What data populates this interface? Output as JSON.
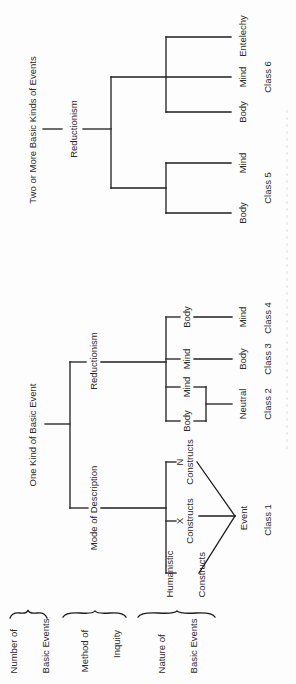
{
  "diagram": {
    "orientation": "rotated 90 degrees counter-clockwise",
    "row_labels": {
      "number_of_basic_events": [
        "Number of",
        "Basic Events"
      ],
      "method_of_inquiry": [
        "Method of",
        "Inquity"
      ],
      "nature_of_basic_events": [
        "Nature of",
        "Basic Events"
      ]
    },
    "level1": {
      "one_kind": "One Kind of Basic Event",
      "two_or_more": "Two or More Basic Kinds of Events"
    },
    "level2": {
      "mode_of_description": "Mode of Description",
      "reductionism_one": "Reductionism",
      "reductionism_two": "Reductionism"
    },
    "class1": {
      "n_letter": "N",
      "n_constructs": "Constructs",
      "x_letter": "X",
      "x_constructs": "Constructs",
      "humanistic": [
        "Humanistic",
        "Constructs"
      ],
      "event": "Event",
      "label": "Class 1"
    },
    "class2": {
      "body": "Body",
      "mind": "Mind",
      "result": "Neutral",
      "label": "Class 2"
    },
    "class3": {
      "from": "Mind",
      "to": "Body",
      "label": "Class 3"
    },
    "class4": {
      "from": "Body",
      "to": "Mind",
      "label": "Class 4"
    },
    "class5": {
      "body": "Body",
      "mind": "Mind",
      "label": "Class 5"
    },
    "class6": {
      "body": "Body",
      "mind": "Mind",
      "entelechy": "Entelechy",
      "label": "Class 6"
    }
  }
}
